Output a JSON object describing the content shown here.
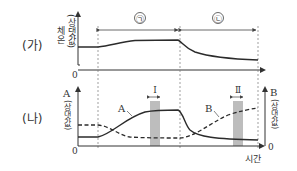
{
  "panels": {
    "ga": {
      "label": "(가)",
      "y_axis_label_main": "체온",
      "y_axis_label_sub": "(상댓값)",
      "zero": "0",
      "intervals": [
        {
          "symbol": "㉠",
          "start_x": 98,
          "end_x": 180
        },
        {
          "symbol": "㉡",
          "start_x": 180,
          "end_x": 258
        }
      ]
    },
    "na": {
      "label": "(나)",
      "left_axis_label_main": "A",
      "left_axis_label_sub": "(상댓값)",
      "right_axis_label_main": "B",
      "right_axis_label_sub": "(상댓값)",
      "zero_left": "0",
      "zero_right": "0",
      "x_axis_label": "시간",
      "series_labels": {
        "A": "A",
        "B": "B"
      },
      "periods": [
        {
          "label": "Ⅰ"
        },
        {
          "label": "Ⅱ"
        }
      ]
    }
  },
  "colors": {
    "line": "#2b2b2b",
    "axis": "#333333",
    "period_shade": "#bdbdbd",
    "dashed_guide": "#777777"
  }
}
